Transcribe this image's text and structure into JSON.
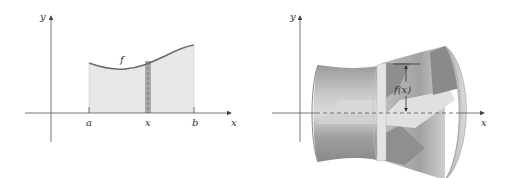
{
  "left_panel": {
    "axis_labels": {
      "x": "x",
      "y": "y"
    },
    "curve_label": "f",
    "tick_labels": {
      "a": "a",
      "x": "x",
      "b": "b"
    },
    "colors": {
      "region_fill": "#e8e8e8",
      "strip_fill": "#a9a9a9",
      "curve": "#6b6b6b",
      "axis": "#555555"
    }
  },
  "right_panel": {
    "axis_labels": {
      "x": "x",
      "y": "y"
    },
    "radius_label": "f(x)",
    "colors": {
      "surface_dark": "#8f8f8f",
      "surface_mid": "#b5b5b5",
      "surface_light": "#dcdcdc",
      "band": "#e4e4e4",
      "axis": "#555555"
    }
  }
}
